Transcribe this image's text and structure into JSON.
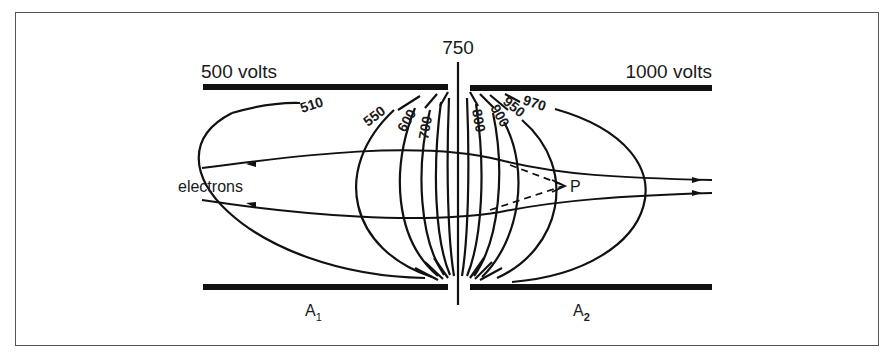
{
  "figure": {
    "center_label": "750",
    "left_plate_label": "500 volts",
    "right_plate_label": "1000 volts",
    "beam_label": "electrons",
    "point_label": "P",
    "anode_left": {
      "letter": "A",
      "subscript": "1"
    },
    "anode_right": {
      "letter": "A",
      "subscript": "2"
    },
    "equipotentials_left": [
      "510",
      "550",
      "600",
      "700"
    ],
    "equipotentials_right": [
      "800",
      "900",
      "950",
      "970"
    ],
    "colors": {
      "ink": "#111111",
      "frame": "#555555",
      "background": "#ffffff"
    }
  }
}
